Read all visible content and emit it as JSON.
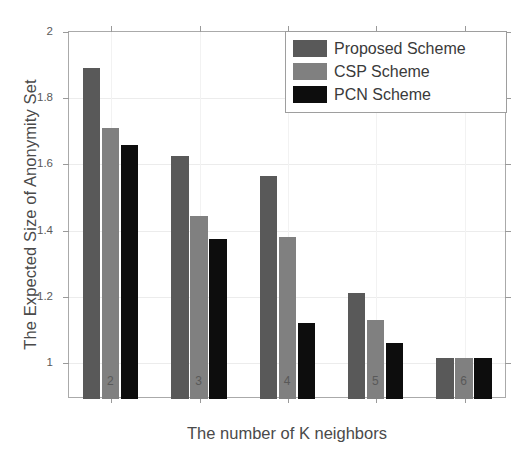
{
  "chart_data": {
    "type": "bar",
    "title": "",
    "xlabel": "The number of K neighbors",
    "ylabel": "The Expected Size of Anonymity Set",
    "categories": [
      "2",
      "3",
      "4",
      "5",
      "6"
    ],
    "xtick_labels": [
      "2",
      "3",
      "4",
      "5",
      "6"
    ],
    "ytick_labels": [
      "1",
      "1.2",
      "1.4",
      "1.6",
      "1.8",
      "2"
    ],
    "ytick_values": [
      1,
      1.2,
      1.4,
      1.6,
      1.8,
      2
    ],
    "ylim": [
      0.891,
      2
    ],
    "xlim": [
      1.52,
      6.48
    ],
    "grid": true,
    "legend_position": "top-right",
    "series": [
      {
        "name": "Proposed Scheme",
        "color": "#595959",
        "values": [
          1.89,
          1.625,
          1.565,
          1.21,
          1.015
        ]
      },
      {
        "name": "CSP Scheme",
        "color": "#808080",
        "values": [
          1.71,
          1.445,
          1.38,
          1.13,
          1.015
        ]
      },
      {
        "name": "PCN Scheme",
        "color": "#0d0d0d",
        "values": [
          1.66,
          1.375,
          1.12,
          1.06,
          1.015
        ]
      }
    ]
  },
  "legend": {
    "items": [
      {
        "label": "Proposed Scheme",
        "color": "#595959"
      },
      {
        "label": "CSP Scheme",
        "color": "#808080"
      },
      {
        "label": "PCN Scheme",
        "color": "#0d0d0d"
      }
    ]
  }
}
